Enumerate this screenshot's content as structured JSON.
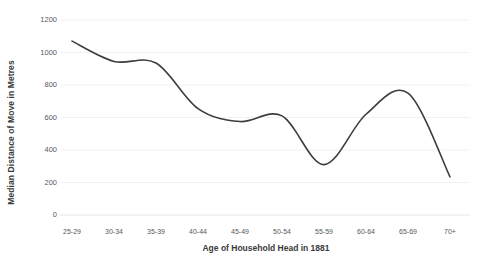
{
  "chart_data": {
    "type": "line",
    "title": "",
    "xlabel": "Age of Household Head in 1881",
    "ylabel": "Median Distance of Move in Metres",
    "categories": [
      "25-29",
      "30-34",
      "35-39",
      "40-44",
      "45-49",
      "50-54",
      "55-59",
      "60-64",
      "65-69",
      "70+"
    ],
    "values": [
      1070,
      945,
      935,
      655,
      575,
      610,
      310,
      620,
      750,
      235
    ],
    "series": [
      {
        "name": "Median distance of move",
        "values": [
          1070,
          945,
          935,
          655,
          575,
          610,
          310,
          620,
          750,
          235
        ]
      }
    ],
    "ylim": [
      0,
      1200
    ],
    "y_ticks": [
      0,
      200,
      400,
      600,
      800,
      1000,
      1200
    ],
    "y_tick_labels": [
      "0",
      "200",
      "400",
      "600",
      "800",
      "1000",
      "1200"
    ],
    "grid": "horizontal",
    "legend": "none",
    "line_color": "#3d3d3d",
    "line_width": 1.6,
    "smoothing": "spline",
    "markers": "none",
    "grid_color": "#f2f2f2",
    "background": "#ffffff"
  },
  "axes": {
    "y_title": "Median Distance of Move in Metres",
    "x_title": "Age of Household Head in 1881"
  }
}
